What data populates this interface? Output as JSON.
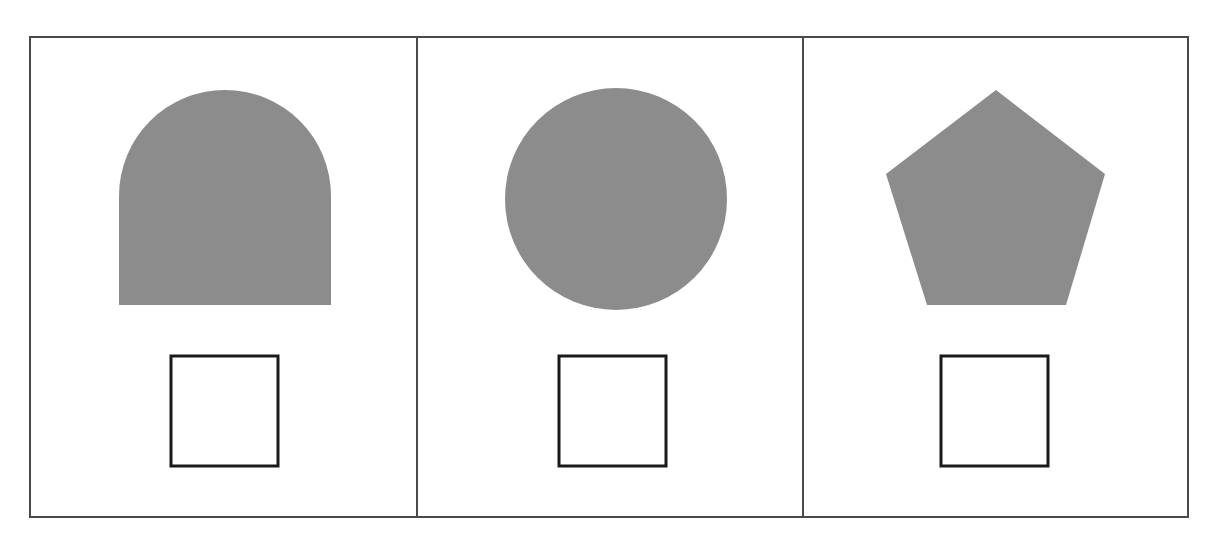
{
  "page": {
    "background_color": "#ffffff",
    "width": 1219,
    "height": 541
  },
  "frame": {
    "name": "outer-frame",
    "x": 30,
    "y": 37,
    "width": 1158,
    "height": 480,
    "stroke_color": "#4a4a4a",
    "stroke_width": 2,
    "fill": "#ffffff"
  },
  "dividers": [
    {
      "label": "divider-1",
      "x": 417,
      "y1": 37,
      "y2": 517,
      "stroke_color": "#4a4a4a",
      "stroke_width": 2
    },
    {
      "label": "divider-2",
      "x": 803,
      "y1": 37,
      "y2": 517,
      "stroke_color": "#4a4a4a",
      "stroke_width": 2
    }
  ],
  "colors": {
    "shape_fill": "#8c8c8c",
    "square_stroke": "#1a1a1a",
    "frame_stroke": "#4a4a4a",
    "page_background": "#ffffff"
  },
  "panels": [
    {
      "index": 1,
      "label": "panel-1",
      "bounds": {
        "x": 30,
        "y": 37,
        "width": 387,
        "height": 480
      },
      "prompt_shape": {
        "name": "arch",
        "semantic": "arch-shape",
        "description": "Filled gray arch: semicircular top on a rectangular base",
        "fill": "#8c8c8c",
        "bounds": {
          "x": 119,
          "y": 90,
          "width": 212,
          "height": 215
        },
        "path": "M 119 196 A 106 106 0 0 1 331 196 L 331 305 L 119 305 Z"
      },
      "answer_box": {
        "name": "empty-square",
        "semantic": "answer-square",
        "description": "Empty square outline placeholder",
        "stroke": "#1a1a1a",
        "stroke_width": 3,
        "fill": "none",
        "bounds": {
          "x": 171,
          "y": 356,
          "width": 107,
          "height": 110
        }
      }
    },
    {
      "index": 2,
      "label": "panel-2",
      "bounds": {
        "x": 417,
        "y": 37,
        "width": 386,
        "height": 480
      },
      "prompt_shape": {
        "name": "circle",
        "semantic": "circle-shape",
        "description": "Filled gray circle",
        "fill": "#8c8c8c",
        "bounds": {
          "x": 505,
          "y": 88,
          "width": 222,
          "height": 222
        },
        "center": {
          "cx": 616,
          "cy": 199
        },
        "radius": 111
      },
      "answer_box": {
        "name": "empty-square",
        "semantic": "answer-square",
        "description": "Empty square outline placeholder",
        "stroke": "#1a1a1a",
        "stroke_width": 3,
        "fill": "none",
        "bounds": {
          "x": 559,
          "y": 356,
          "width": 107,
          "height": 110
        }
      }
    },
    {
      "index": 3,
      "label": "panel-3",
      "bounds": {
        "x": 803,
        "y": 37,
        "width": 385,
        "height": 480
      },
      "prompt_shape": {
        "name": "pentagon",
        "semantic": "pentagon-shape",
        "description": "Filled gray regular pentagon, point up",
        "fill": "#8c8c8c",
        "bounds": {
          "x": 885,
          "y": 90,
          "width": 220,
          "height": 215
        },
        "vertices": [
          {
            "x": 996,
            "y": 90
          },
          {
            "x": 1105,
            "y": 174
          },
          {
            "x": 1066,
            "y": 305
          },
          {
            "x": 927,
            "y": 305
          },
          {
            "x": 886,
            "y": 174
          }
        ],
        "points": "996,90 1105,174 1066,305 927,305 886,174"
      },
      "answer_box": {
        "name": "empty-square",
        "semantic": "answer-square",
        "description": "Empty square outline placeholder",
        "stroke": "#1a1a1a",
        "stroke_width": 3,
        "fill": "none",
        "bounds": {
          "x": 941,
          "y": 356,
          "width": 107,
          "height": 110
        }
      }
    }
  ]
}
